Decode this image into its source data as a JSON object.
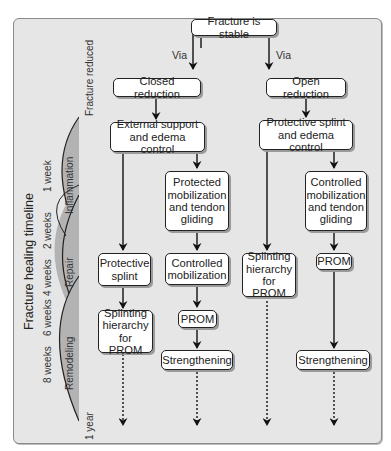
{
  "diagram": {
    "root": "Fracture is stable",
    "via_left": "Via",
    "via_right": "Via",
    "closed_branch": {
      "reduction": "Closed reduction",
      "first": "External support and edema control",
      "left_path": [
        "Protective splint",
        "Splinting hierarchy for PROM"
      ],
      "right_path": [
        "Protected mobilization and tendon gliding",
        "Controlled mobilization",
        "PROM",
        "Strengthening"
      ]
    },
    "open_branch": {
      "reduction": "Open reduction",
      "first": "Protective splint and edema control",
      "left_path": [
        "Splinting hierarchy for PROM"
      ],
      "right_path": [
        "Controlled mobilization and tendon gliding",
        "PROM",
        "Strengthening"
      ]
    }
  },
  "timeline": {
    "title": "Fracture healing timeline",
    "start_label": "Fracture reduced",
    "end_label": "1 year",
    "phases": [
      "Inflammation",
      "Repair",
      "Remodeling"
    ],
    "ticks": [
      "1 week",
      "2 weeks",
      "4 weeks",
      "6 weeks",
      "8 weeks"
    ],
    "phase_color": "#b3b3b3"
  }
}
